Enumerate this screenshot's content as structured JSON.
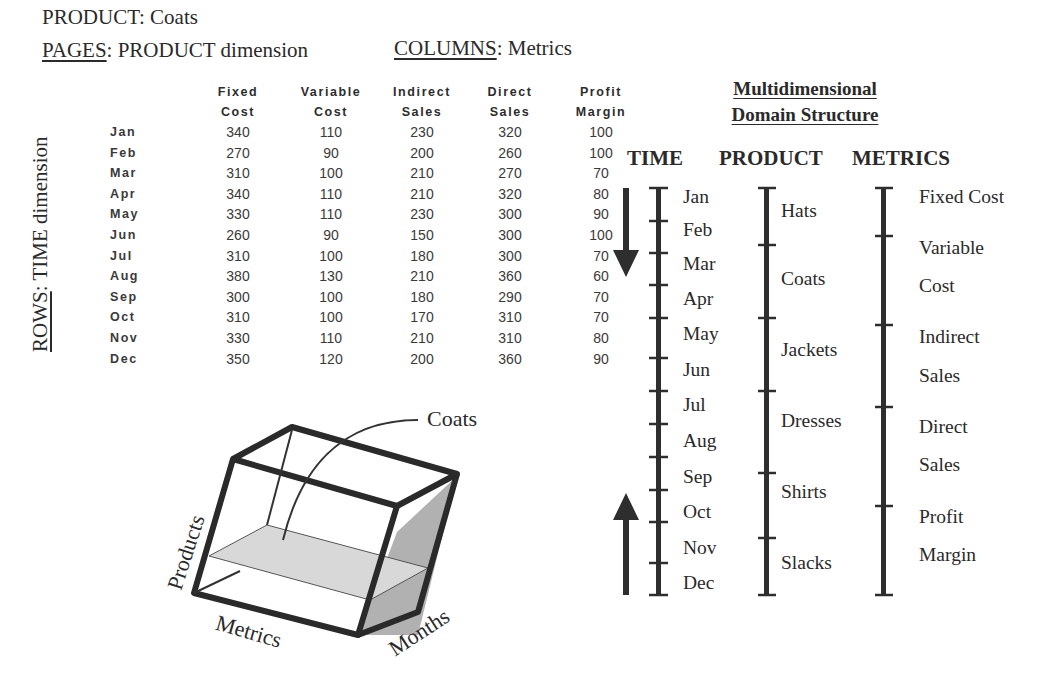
{
  "header": {
    "product_label": "PRODUCT",
    "product_value": ": Coats",
    "pages_label": "PAGES",
    "pages_value": ": PRODUCT dimension",
    "columns_label": "COLUMNS",
    "columns_value": ": Metrics",
    "rows_label": "ROWS",
    "rows_value": ": TIME dimension"
  },
  "table": {
    "columns": [
      {
        "line1": "Fixed",
        "line2": "Cost"
      },
      {
        "line1": "Variable",
        "line2": "Cost"
      },
      {
        "line1": "Indirect",
        "line2": "Sales"
      },
      {
        "line1": "Direct",
        "line2": "Sales"
      },
      {
        "line1": "Profit",
        "line2": "Margin"
      }
    ],
    "rows": [
      {
        "month": "Jan",
        "values": [
          "340",
          "110",
          "230",
          "320",
          "100"
        ]
      },
      {
        "month": "Feb",
        "values": [
          "270",
          "90",
          "200",
          "260",
          "100"
        ]
      },
      {
        "month": "Mar",
        "values": [
          "310",
          "100",
          "210",
          "270",
          "70"
        ]
      },
      {
        "month": "Apr",
        "values": [
          "340",
          "110",
          "210",
          "320",
          "80"
        ]
      },
      {
        "month": "May",
        "values": [
          "330",
          "110",
          "230",
          "300",
          "90"
        ]
      },
      {
        "month": "Jun",
        "values": [
          "260",
          "90",
          "150",
          "300",
          "100"
        ]
      },
      {
        "month": "Jul",
        "values": [
          "310",
          "100",
          "180",
          "300",
          "70"
        ]
      },
      {
        "month": "Aug",
        "values": [
          "380",
          "130",
          "210",
          "360",
          "60"
        ]
      },
      {
        "month": "Sep",
        "values": [
          "300",
          "100",
          "180",
          "290",
          "70"
        ]
      },
      {
        "month": "Oct",
        "values": [
          "310",
          "100",
          "170",
          "310",
          "70"
        ]
      },
      {
        "month": "Nov",
        "values": [
          "330",
          "110",
          "210",
          "310",
          "80"
        ]
      },
      {
        "month": "Dec",
        "values": [
          "350",
          "120",
          "200",
          "360",
          "90"
        ]
      }
    ]
  },
  "cube": {
    "slice_label": "Coats",
    "axis_products": "Products",
    "axis_metrics": "Metrics",
    "axis_months": "Months",
    "slice_color": "#d8d8d8",
    "side_color": "#a8a8a8"
  },
  "structure": {
    "title_line1": "Multidimensional",
    "title_line2": "Domain  Structure",
    "dimensions": {
      "time": {
        "header": "TIME",
        "items": [
          "Jan",
          "Feb",
          "Mar",
          "Apr",
          "May",
          "Jun",
          "Jul",
          "Aug",
          "Sep",
          "Oct",
          "Nov",
          "Dec"
        ]
      },
      "product": {
        "header": "PRODUCT",
        "items": [
          "Hats",
          "Coats",
          "Jackets",
          "Dresses",
          "Shirts",
          "Slacks"
        ]
      },
      "metrics": {
        "header": "METRICS",
        "items": [
          "Fixed Cost",
          "Variable",
          "Cost",
          "Indirect",
          "Sales",
          "Direct",
          "Sales",
          "Profit",
          "Margin"
        ]
      }
    }
  }
}
